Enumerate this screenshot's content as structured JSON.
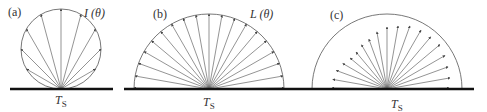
{
  "figure": {
    "colors": {
      "ray": "#666666",
      "envelope": "#555555",
      "surface": "#111111",
      "text": "#333333"
    },
    "panels": [
      {
        "id": "a",
        "label": "(a)",
        "label_pos": [
          8,
          16
        ],
        "quantity_symbol": "I",
        "quantity_arg": "(θ)",
        "quantity_pos": [
          84,
          17
        ],
        "surface_label": "T",
        "surface_sub": "S",
        "surface_label_pos": [
          55,
          104
        ],
        "origin": [
          61,
          89
        ],
        "surface": [
          10,
          113
        ],
        "envelope": {
          "type": "circle",
          "cx": 61,
          "cy": 49,
          "r": 40
        },
        "ray_angles_deg": [
          -60,
          -45,
          -30,
          -15,
          0,
          15,
          30,
          45,
          60
        ],
        "ray_model": "cosine",
        "ray_scale": 80
      },
      {
        "id": "b",
        "label": "(b)",
        "label_pos": [
          153,
          18
        ],
        "quantity_symbol": "L",
        "quantity_arg": "(θ)",
        "quantity_pos": [
          250,
          18
        ],
        "surface_label": "T",
        "surface_sub": "S",
        "surface_label_pos": [
          203,
          106
        ],
        "origin": [
          209,
          89
        ],
        "surface": [
          124,
          303
        ],
        "envelope": {
          "type": "semicircle",
          "cx": 209,
          "cy": 89,
          "r": 75
        },
        "ray_angles_deg": [
          -90,
          -80,
          -70,
          -60,
          -50,
          -40,
          -30,
          -20,
          -10,
          0,
          10,
          20,
          30,
          40,
          50,
          60,
          70,
          80,
          90
        ],
        "ray_model": "uniform",
        "ray_scale": 75
      },
      {
        "id": "c",
        "label": "(c)",
        "label_pos": [
          330,
          19
        ],
        "surface_label": "T",
        "surface_sub": "S",
        "surface_label_pos": [
          391,
          108
        ],
        "origin": [
          387,
          89
        ],
        "surface": [
          303,
          474
        ],
        "envelope": {
          "type": "semicircle",
          "cx": 387,
          "cy": 89,
          "r": 75
        },
        "ray_angles_deg": [
          -90,
          -80,
          -70,
          -60,
          -50,
          -40,
          -30,
          -20,
          -10,
          0,
          10,
          20,
          30,
          40,
          50,
          60,
          70,
          80,
          90
        ],
        "ray_lengths": [
          55,
          55,
          54,
          51,
          48,
          48,
          51,
          53,
          58,
          62,
          64,
          67,
          68,
          68,
          69,
          67,
          65,
          64,
          62
        ],
        "ray_model": "explicit"
      }
    ]
  }
}
